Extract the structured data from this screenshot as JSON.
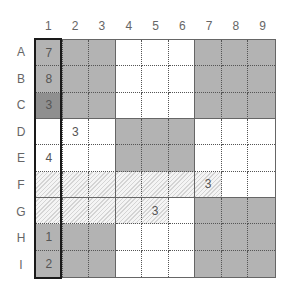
{
  "puzzle": {
    "type": "sudoku",
    "column_labels": [
      "1",
      "2",
      "3",
      "4",
      "5",
      "6",
      "7",
      "8",
      "9"
    ],
    "row_labels": [
      "A",
      "B",
      "C",
      "D",
      "E",
      "F",
      "G",
      "H",
      "I"
    ],
    "highlighted_column": "1",
    "colors": {
      "gray": "#b3b3b3",
      "dark_gray": "#8f8f8f",
      "white": "#ffffff",
      "hatch": "#d4d4d4",
      "outline": "#1a1a1a"
    },
    "rows": [
      {
        "label": "A",
        "cells": [
          {
            "value": "7",
            "fill": "gray"
          },
          {
            "value": "",
            "fill": "gray"
          },
          {
            "value": "",
            "fill": "gray"
          },
          {
            "value": "",
            "fill": "white"
          },
          {
            "value": "",
            "fill": "white"
          },
          {
            "value": "",
            "fill": "white"
          },
          {
            "value": "",
            "fill": "gray"
          },
          {
            "value": "",
            "fill": "gray"
          },
          {
            "value": "",
            "fill": "gray"
          }
        ]
      },
      {
        "label": "B",
        "cells": [
          {
            "value": "8",
            "fill": "gray"
          },
          {
            "value": "",
            "fill": "gray"
          },
          {
            "value": "",
            "fill": "gray"
          },
          {
            "value": "",
            "fill": "white"
          },
          {
            "value": "",
            "fill": "white"
          },
          {
            "value": "",
            "fill": "white"
          },
          {
            "value": "",
            "fill": "gray"
          },
          {
            "value": "",
            "fill": "gray"
          },
          {
            "value": "",
            "fill": "gray"
          }
        ]
      },
      {
        "label": "C",
        "cells": [
          {
            "value": "3",
            "fill": "dark"
          },
          {
            "value": "",
            "fill": "gray"
          },
          {
            "value": "",
            "fill": "gray"
          },
          {
            "value": "",
            "fill": "white"
          },
          {
            "value": "",
            "fill": "white"
          },
          {
            "value": "",
            "fill": "white"
          },
          {
            "value": "",
            "fill": "gray"
          },
          {
            "value": "",
            "fill": "gray"
          },
          {
            "value": "",
            "fill": "gray"
          }
        ]
      },
      {
        "label": "D",
        "cells": [
          {
            "value": "",
            "fill": "white"
          },
          {
            "value": "3",
            "fill": "white"
          },
          {
            "value": "",
            "fill": "white"
          },
          {
            "value": "",
            "fill": "gray"
          },
          {
            "value": "",
            "fill": "gray"
          },
          {
            "value": "",
            "fill": "gray"
          },
          {
            "value": "",
            "fill": "white"
          },
          {
            "value": "",
            "fill": "white"
          },
          {
            "value": "",
            "fill": "white"
          }
        ]
      },
      {
        "label": "E",
        "cells": [
          {
            "value": "4",
            "fill": "white"
          },
          {
            "value": "",
            "fill": "white"
          },
          {
            "value": "",
            "fill": "white"
          },
          {
            "value": "",
            "fill": "gray"
          },
          {
            "value": "",
            "fill": "gray"
          },
          {
            "value": "",
            "fill": "gray"
          },
          {
            "value": "",
            "fill": "white"
          },
          {
            "value": "",
            "fill": "white"
          },
          {
            "value": "",
            "fill": "white"
          }
        ]
      },
      {
        "label": "F",
        "cells": [
          {
            "value": "",
            "fill": "hatch"
          },
          {
            "value": "",
            "fill": "hatch"
          },
          {
            "value": "",
            "fill": "hatch"
          },
          {
            "value": "",
            "fill": "hatch"
          },
          {
            "value": "",
            "fill": "hatch"
          },
          {
            "value": "",
            "fill": "hatch"
          },
          {
            "value": "3",
            "fill": "hatch"
          },
          {
            "value": "",
            "fill": "white"
          },
          {
            "value": "",
            "fill": "white"
          }
        ]
      },
      {
        "label": "G",
        "cells": [
          {
            "value": "",
            "fill": "hatch"
          },
          {
            "value": "",
            "fill": "hatch"
          },
          {
            "value": "",
            "fill": "hatch"
          },
          {
            "value": "",
            "fill": "hatch"
          },
          {
            "value": "3",
            "fill": "hatch"
          },
          {
            "value": "",
            "fill": "white"
          },
          {
            "value": "",
            "fill": "gray"
          },
          {
            "value": "",
            "fill": "gray"
          },
          {
            "value": "",
            "fill": "gray"
          }
        ]
      },
      {
        "label": "H",
        "cells": [
          {
            "value": "1",
            "fill": "gray"
          },
          {
            "value": "",
            "fill": "gray"
          },
          {
            "value": "",
            "fill": "gray"
          },
          {
            "value": "",
            "fill": "white"
          },
          {
            "value": "",
            "fill": "white"
          },
          {
            "value": "",
            "fill": "white"
          },
          {
            "value": "",
            "fill": "gray"
          },
          {
            "value": "",
            "fill": "gray"
          },
          {
            "value": "",
            "fill": "gray"
          }
        ]
      },
      {
        "label": "I",
        "cells": [
          {
            "value": "2",
            "fill": "gray"
          },
          {
            "value": "",
            "fill": "gray"
          },
          {
            "value": "",
            "fill": "gray"
          },
          {
            "value": "",
            "fill": "white"
          },
          {
            "value": "",
            "fill": "white"
          },
          {
            "value": "",
            "fill": "white"
          },
          {
            "value": "",
            "fill": "gray"
          },
          {
            "value": "",
            "fill": "gray"
          },
          {
            "value": "",
            "fill": "gray"
          }
        ]
      }
    ]
  }
}
